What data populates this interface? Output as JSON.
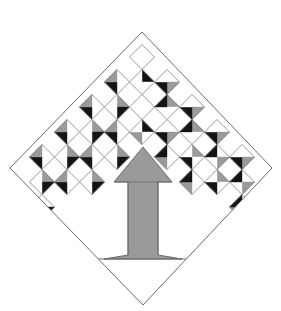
{
  "figure": {
    "canvas": {
      "width": 281,
      "height": 311,
      "background": "#ffffff"
    },
    "header_fragment": {
      "name": "photo-strip-fragment",
      "description": "dark cropped photographic strip at top of page",
      "x": 46,
      "y": 0,
      "width": 78,
      "height": 17,
      "colors": [
        "#1a1a1a",
        "#3d3a38",
        "#6b6560",
        "#9a948c",
        "#ffffff"
      ]
    },
    "outer_diamond": {
      "name": "outer-diamond-outline",
      "stroke": "#6b6b6b",
      "stroke_width": 1,
      "fill": "none",
      "vertices": [
        {
          "label": "top",
          "x": 142,
          "y": 32
        },
        {
          "label": "right",
          "x": 272,
          "y": 168
        },
        {
          "label": "bottom",
          "x": 143,
          "y": 305
        },
        {
          "label": "left",
          "x": 10,
          "y": 168
        }
      ]
    },
    "center_motif": {
      "name": "center-tree-arrow",
      "fill": "#9a9a9a",
      "stroke": "#6b6b6b",
      "stroke_width": 1,
      "apex": {
        "x": 143,
        "y": 147
      },
      "canopy_half_width": 29,
      "canopy_base_y": 182,
      "trunk_left_x": 128,
      "trunk_right_x": 158,
      "trunk_bottom_y": 255,
      "foot_left_x": 104,
      "foot_right_x": 182,
      "ground_y": 259
    },
    "ground_line": {
      "name": "ground-line",
      "x1": 92,
      "y1": 259,
      "x2": 194,
      "y2": 259,
      "stroke": "#6b6b6b"
    },
    "palette": {
      "white": "#ffffff",
      "gray": "#9a9a9a",
      "black": "#141414",
      "outline": "#6b6b6b",
      "background": "#ffffff"
    },
    "grid": {
      "name": "chevron-diamond-grid",
      "cell_width": 25,
      "cell_height": 25,
      "rows": 6,
      "description": "Chevron (inverted-V) arrangement of square-on-point cells, each split into four triangles; left half and right half are mirror images."
    }
  },
  "chart_data": {
    "type": "diagram",
    "legend": [
      {
        "label": "white patch",
        "color": "#ffffff"
      },
      {
        "label": "gray patch",
        "color": "#9a9a9a"
      },
      {
        "label": "black patch",
        "color": "#141414"
      }
    ],
    "cells": [
      {
        "row": 0,
        "col": 0,
        "cx": 142,
        "cy": 57,
        "top": "white",
        "right": "white",
        "bottom": "white",
        "left": "white"
      },
      {
        "row": 1,
        "col": -1,
        "cx": 117,
        "cy": 82,
        "top": "white",
        "right": "white",
        "bottom": "black",
        "left": "gray"
      },
      {
        "row": 1,
        "col": 0,
        "cx": 142,
        "cy": 82,
        "top": "black",
        "right": "white",
        "bottom": "white",
        "left": "white"
      },
      {
        "row": 1,
        "col": 1,
        "cx": 167,
        "cy": 82,
        "top": "white",
        "right": "gray",
        "bottom": "black",
        "left": "white"
      },
      {
        "row": 2,
        "col": -2,
        "cx": 92,
        "cy": 107,
        "top": "white",
        "right": "white",
        "bottom": "black",
        "left": "gray"
      },
      {
        "row": 2,
        "col": -1,
        "cx": 117,
        "cy": 107,
        "top": "gray",
        "right": "black",
        "bottom": "white",
        "left": "white"
      },
      {
        "row": 2,
        "col": 0,
        "cx": 142,
        "cy": 107,
        "top": "white",
        "right": "white",
        "bottom": "white",
        "left": "white"
      },
      {
        "row": 2,
        "col": 1,
        "cx": 167,
        "cy": 107,
        "top": "gray",
        "right": "white",
        "bottom": "white",
        "left": "black"
      },
      {
        "row": 2,
        "col": 2,
        "cx": 192,
        "cy": 107,
        "top": "white",
        "right": "gray",
        "bottom": "black",
        "left": "white"
      },
      {
        "row": 3,
        "col": -3,
        "cx": 67,
        "cy": 132,
        "top": "white",
        "right": "white",
        "bottom": "black",
        "left": "gray"
      },
      {
        "row": 3,
        "col": -2,
        "cx": 92,
        "cy": 132,
        "top": "gray",
        "right": "black",
        "bottom": "white",
        "left": "white"
      },
      {
        "row": 3,
        "col": -1,
        "cx": 117,
        "cy": 132,
        "top": "white",
        "right": "white",
        "bottom": "black",
        "left": "gray"
      },
      {
        "row": 3,
        "col": 0,
        "cx": 142,
        "cy": 132,
        "top": "black",
        "right": "white",
        "bottom": "gray",
        "left": "white"
      },
      {
        "row": 3,
        "col": 1,
        "cx": 167,
        "cy": 132,
        "top": "white",
        "right": "gray",
        "bottom": "black",
        "left": "white"
      },
      {
        "row": 3,
        "col": 2,
        "cx": 192,
        "cy": 132,
        "top": "gray",
        "right": "white",
        "bottom": "white",
        "left": "black"
      },
      {
        "row": 3,
        "col": 3,
        "cx": 217,
        "cy": 132,
        "top": "white",
        "right": "gray",
        "bottom": "black",
        "left": "white"
      },
      {
        "row": 4,
        "col": -4,
        "cx": 42,
        "cy": 157,
        "top": "white",
        "right": "white",
        "bottom": "black",
        "left": "gray"
      },
      {
        "row": 4,
        "col": -3,
        "cx": 67,
        "cy": 157,
        "top": "gray",
        "right": "black",
        "bottom": "white",
        "left": "white"
      },
      {
        "row": 4,
        "col": -2,
        "cx": 92,
        "cy": 157,
        "top": "white",
        "right": "white",
        "bottom": "black",
        "left": "gray"
      },
      {
        "row": 4,
        "col": -1,
        "cx": 117,
        "cy": 157,
        "top": "gray",
        "right": "black",
        "bottom": "white",
        "left": "white"
      },
      {
        "row": 4,
        "col": 1,
        "cx": 167,
        "cy": 157,
        "top": "white",
        "right": "white",
        "bottom": "gray",
        "left": "black"
      },
      {
        "row": 4,
        "col": 2,
        "cx": 192,
        "cy": 157,
        "top": "gray",
        "right": "white",
        "bottom": "black",
        "left": "white"
      },
      {
        "row": 4,
        "col": 3,
        "cx": 217,
        "cy": 157,
        "top": "white",
        "right": "gray",
        "bottom": "white",
        "left": "black"
      },
      {
        "row": 4,
        "col": 4,
        "cx": 242,
        "cy": 157,
        "top": "white",
        "right": "gray",
        "bottom": "black",
        "left": "white"
      },
      {
        "row": 5,
        "col": -4,
        "cx": 42,
        "cy": 182,
        "top": "gray",
        "right": "black",
        "bottom": "white",
        "left": "white"
      },
      {
        "row": 5,
        "col": -3,
        "cx": 67,
        "cy": 182,
        "top": "white",
        "right": "white",
        "bottom": "black",
        "left": "gray"
      },
      {
        "row": 5,
        "col": -2,
        "cx": 92,
        "cy": 182,
        "top": "gray",
        "right": "black",
        "bottom": "white",
        "left": "white"
      },
      {
        "row": 5,
        "col": 2,
        "cx": 192,
        "cy": 182,
        "top": "white",
        "right": "white",
        "bottom": "gray",
        "left": "black"
      },
      {
        "row": 5,
        "col": 3,
        "cx": 217,
        "cy": 182,
        "top": "gray",
        "right": "white",
        "bottom": "black",
        "left": "white"
      },
      {
        "row": 5,
        "col": 4,
        "cx": 242,
        "cy": 182,
        "top": "white",
        "right": "gray",
        "bottom": "white",
        "left": "black"
      },
      {
        "row": 6,
        "col": -4,
        "cx": 42,
        "cy": 207,
        "top": "white",
        "right": "black",
        "bottom": "gray",
        "left": "white"
      },
      {
        "row": 6,
        "col": 4,
        "cx": 242,
        "cy": 207,
        "top": "white",
        "right": "white",
        "bottom": "gray",
        "left": "black"
      }
    ]
  }
}
